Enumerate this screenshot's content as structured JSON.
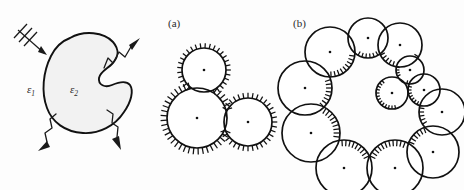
{
  "figure": {
    "background_color": "#fdfdfd",
    "ink_color": "#111111",
    "body_fill_color": "#f2f2f2",
    "width": 464,
    "height": 190
  },
  "panels": [
    {
      "id": "scattering-body",
      "label": "",
      "description": "Incident plane wave striking a kidney-shaped scatterer with scattered wavy arrows radiating outward",
      "labels": {
        "exterior_permittivity": "ε",
        "exterior_permittivity_subscript": "1",
        "interior_permittivity": "ε",
        "interior_permittivity_subscript": "2"
      },
      "waves": [
        {
          "name": "incident-wave",
          "direction": "down-right",
          "style": "straight-with-wavefronts",
          "wavefront_count": 3
        },
        {
          "name": "scattered-wave-upper-right",
          "direction": "up-right",
          "style": "squiggly"
        },
        {
          "name": "scattered-wave-lower-right",
          "direction": "down",
          "style": "squiggly"
        },
        {
          "name": "scattered-wave-lower-left",
          "direction": "down-left",
          "style": "squiggly"
        }
      ]
    },
    {
      "id": "panel-a",
      "label": "(a)",
      "description": "Three overlapping circles covering the body, hatch marks on the exterior boundary",
      "circle_count": 3,
      "hatch_side": "outward"
    },
    {
      "id": "panel-b",
      "label": "(b)",
      "description": "Twelve overlapping circles arranged in a ring around a kidney-shaped cavity, hatch marks on the interior boundary",
      "circle_count": 12,
      "hatch_side": "inward"
    }
  ],
  "chart_data": {
    "type": "scatter",
    "xlabel": "",
    "ylabel": "",
    "panel_a_circles": [
      {
        "cx": 204,
        "cy": 70,
        "r": 22
      },
      {
        "cx": 197,
        "cy": 118,
        "r": 30
      },
      {
        "cx": 248,
        "cy": 122,
        "r": 24
      }
    ],
    "panel_b_circles": [
      {
        "cx": 330,
        "cy": 52,
        "r": 25
      },
      {
        "cx": 368,
        "cy": 38,
        "r": 20
      },
      {
        "cx": 400,
        "cy": 45,
        "r": 22
      },
      {
        "cx": 410,
        "cy": 70,
        "r": 14
      },
      {
        "cx": 392,
        "cy": 93,
        "r": 16
      },
      {
        "cx": 424,
        "cy": 90,
        "r": 16
      },
      {
        "cx": 442,
        "cy": 112,
        "r": 23
      },
      {
        "cx": 433,
        "cy": 152,
        "r": 26
      },
      {
        "cx": 395,
        "cy": 168,
        "r": 28
      },
      {
        "cx": 344,
        "cy": 168,
        "r": 28
      },
      {
        "cx": 311,
        "cy": 133,
        "r": 29
      },
      {
        "cx": 305,
        "cy": 88,
        "r": 27
      }
    ]
  }
}
